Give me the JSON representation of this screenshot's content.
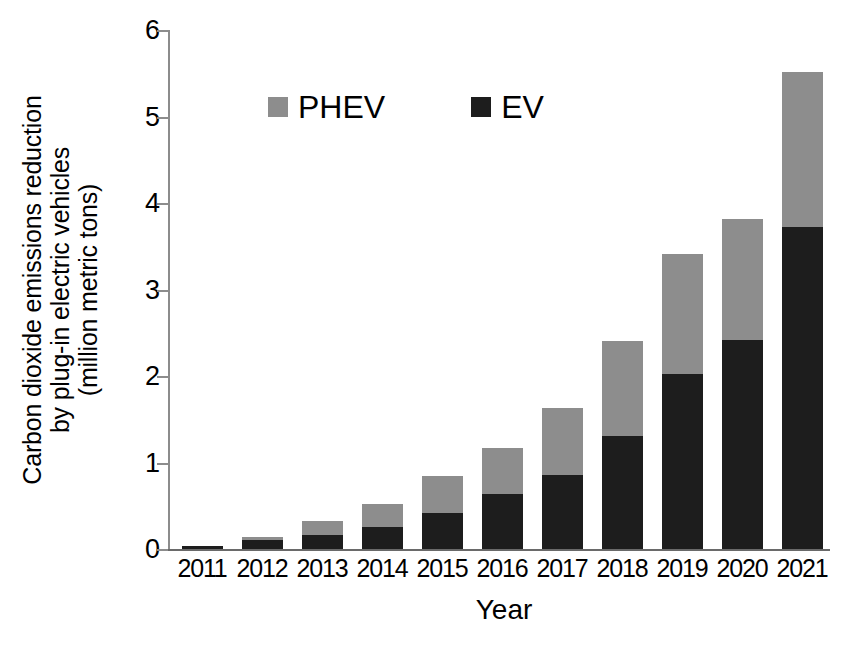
{
  "chart_data": {
    "type": "bar",
    "subtype": "stacked-vertical",
    "title": "",
    "xlabel": "Year",
    "ylabel": "Carbon dioxide emissions reduction by plug-in electric vehicles (million metric tons)",
    "ylabel_lines": [
      "Carbon dioxide emissions reduction",
      "by plug-in electric vehicles",
      "(million metric tons)"
    ],
    "categories": [
      "2011",
      "2012",
      "2013",
      "2014",
      "2015",
      "2016",
      "2017",
      "2018",
      "2019",
      "2020",
      "2021"
    ],
    "series": [
      {
        "name": "EV",
        "color": "#1d1d1d",
        "values": [
          0.03,
          0.1,
          0.16,
          0.25,
          0.42,
          0.64,
          0.86,
          1.31,
          2.02,
          2.42,
          3.72
        ]
      },
      {
        "name": "PHEV",
        "color": "#8d8d8d",
        "values": [
          0.0,
          0.04,
          0.16,
          0.27,
          0.42,
          0.53,
          0.77,
          1.1,
          1.39,
          1.39,
          1.8
        ]
      }
    ],
    "totals": [
      0.03,
      0.14,
      0.32,
      0.52,
      0.84,
      1.17,
      1.63,
      2.41,
      3.41,
      3.81,
      5.52
    ],
    "ylim": [
      0,
      6
    ],
    "yticks": [
      0,
      1,
      2,
      3,
      4,
      5,
      6
    ],
    "ytick_labels": [
      "0",
      "1",
      "2",
      "3",
      "4",
      "5",
      "6"
    ],
    "xtick_labels": [
      "2011",
      "2012",
      "2013",
      "2014",
      "2015",
      "2016",
      "2017",
      "2018",
      "2019",
      "2020",
      "2021"
    ],
    "grid": false,
    "legend_position": "upper-left-inside",
    "legend": [
      {
        "label": "PHEV",
        "color": "#8d8d8d"
      },
      {
        "label": "EV",
        "color": "#1d1d1d"
      }
    ]
  },
  "legend": {
    "phev_label": "PHEV",
    "ev_label": "EV"
  },
  "axes": {
    "x_title": "Year",
    "y_title_line1": "Carbon dioxide emissions reduction",
    "y_title_line2": "by plug-in electric vehicles",
    "y_title_line3": "(million metric tons)"
  },
  "colors": {
    "ev": "#1d1d1d",
    "phev": "#8d8d8d",
    "axis": "#8c8c8c",
    "background": "#ffffff"
  }
}
